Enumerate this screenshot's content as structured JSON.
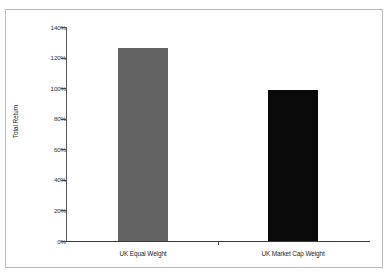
{
  "figure": {
    "clipped_title": "",
    "frame_color": "#b9b9b9"
  },
  "chart_data": {
    "type": "bar",
    "title": "",
    "xlabel": "",
    "ylabel": "Total Return",
    "categories": [
      "UK Equal Weight",
      "UK Market Cap Weight"
    ],
    "values": [
      126,
      99
    ],
    "value_labels": [
      "126%",
      "99%"
    ],
    "ylim": [
      0,
      140
    ],
    "y_ticks": [
      0,
      20,
      40,
      60,
      80,
      100,
      120,
      140
    ],
    "y_tick_labels": [
      "0%",
      "20%",
      "40%",
      "60%",
      "80%",
      "100%",
      "120%",
      "140%"
    ],
    "grid": false,
    "legend": false,
    "bar_colors": [
      "#636363",
      "#0a0a0a"
    ],
    "axis_color": "#3b3b3d"
  }
}
